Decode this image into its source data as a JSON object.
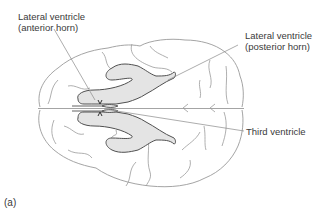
{
  "diagram": {
    "labels": {
      "anterior_horn": {
        "line1": "Lateral ventricle",
        "line2": "(anterior horn)"
      },
      "posterior_horn": {
        "line1": "Lateral ventricle",
        "line2": "(posterior horn)"
      },
      "third_ventricle": {
        "line1": "Third ventricle"
      },
      "figure_label": "(a)"
    },
    "colors": {
      "outline": "#9a9a9a",
      "ventricle_fill": "#e4e4e4",
      "ventricle_stroke": "#505050",
      "leader_line": "#8a8a8a",
      "text": "#3a3a3a"
    }
  }
}
